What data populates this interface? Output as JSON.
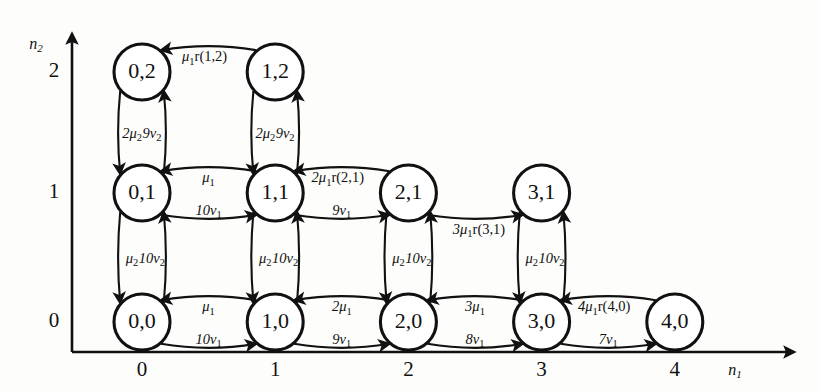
{
  "axes": {
    "x": {
      "name": "n1",
      "name_base": "n",
      "name_sub": "1",
      "ticks": [
        "0",
        "1",
        "2",
        "3",
        "4"
      ]
    },
    "y": {
      "name": "n2",
      "name_base": "n",
      "name_sub": "2",
      "ticks": [
        "0",
        "1",
        "2"
      ]
    }
  },
  "nodes": [
    {
      "id": "0-0",
      "label": "0,0",
      "n1": 0,
      "n2": 0
    },
    {
      "id": "1-0",
      "label": "1,0",
      "n1": 1,
      "n2": 0
    },
    {
      "id": "2-0",
      "label": "2,0",
      "n1": 2,
      "n2": 0
    },
    {
      "id": "3-0",
      "label": "3,0",
      "n1": 3,
      "n2": 0
    },
    {
      "id": "4-0",
      "label": "4,0",
      "n1": 4,
      "n2": 0
    },
    {
      "id": "0-1",
      "label": "0,1",
      "n1": 0,
      "n2": 1
    },
    {
      "id": "1-1",
      "label": "1,1",
      "n1": 1,
      "n2": 1
    },
    {
      "id": "2-1",
      "label": "2,1",
      "n1": 2,
      "n2": 1
    },
    {
      "id": "3-1",
      "label": "3,1",
      "n1": 3,
      "n2": 1
    },
    {
      "id": "0-2",
      "label": "0,2",
      "n1": 0,
      "n2": 2
    },
    {
      "id": "1-2",
      "label": "1,2",
      "n1": 1,
      "n2": 2
    }
  ],
  "edges": [
    {
      "from": "0-0",
      "to": "1-0",
      "label": "10v1",
      "base": "10v",
      "sub": "1",
      "pos": "above"
    },
    {
      "from": "1-0",
      "to": "0-0",
      "label": "mu1",
      "base": "μ",
      "sub": "1",
      "pos": "below"
    },
    {
      "from": "1-0",
      "to": "2-0",
      "label": "9v1",
      "base": "9v",
      "sub": "1",
      "pos": "above"
    },
    {
      "from": "2-0",
      "to": "1-0",
      "label": "2mu1",
      "base": "2μ",
      "sub": "1",
      "pos": "below"
    },
    {
      "from": "2-0",
      "to": "3-0",
      "label": "8v1",
      "base": "8v",
      "sub": "1",
      "pos": "above"
    },
    {
      "from": "3-0",
      "to": "2-0",
      "label": "3mu1",
      "base": "3μ",
      "sub": "1",
      "pos": "below"
    },
    {
      "from": "3-0",
      "to": "4-0",
      "label": "7v1",
      "base": "7v",
      "sub": "1",
      "pos": "above"
    },
    {
      "from": "4-0",
      "to": "3-0",
      "label": "4mu1r(4,0)",
      "base": "4μ",
      "sub": "1",
      "tail": "r(4,0)",
      "pos": "below"
    },
    {
      "from": "0-1",
      "to": "1-1",
      "label": "10v1",
      "base": "10v",
      "sub": "1",
      "pos": "above"
    },
    {
      "from": "1-1",
      "to": "0-1",
      "label": "mu1",
      "base": "μ",
      "sub": "1",
      "pos": "below"
    },
    {
      "from": "1-1",
      "to": "2-1",
      "label": "9v1",
      "base": "9v",
      "sub": "1",
      "pos": "above"
    },
    {
      "from": "2-1",
      "to": "1-1",
      "label": "2mu1r(2,1)",
      "base": "2μ",
      "sub": "1",
      "tail": "r(2,1)",
      "pos": "below"
    },
    {
      "from": "2-1",
      "to": "3-1",
      "label": "3mu1r(3,1)",
      "base": "3μ",
      "sub": "1",
      "tail": "r(3,1)",
      "pos": "below"
    },
    {
      "from": "1-2",
      "to": "0-2",
      "label": "mu1r(1,2)",
      "base": "μ",
      "sub": "1",
      "tail": "r(1,2)",
      "pos": "below"
    },
    {
      "from": "0-0",
      "to": "0-1",
      "label": "10v2",
      "base": "10v",
      "sub": "2",
      "pos": "left"
    },
    {
      "from": "0-1",
      "to": "0-0",
      "label": "mu2",
      "base": "μ",
      "sub": "2",
      "pos": "right"
    },
    {
      "from": "1-0",
      "to": "1-1",
      "label": "10v2",
      "base": "10v",
      "sub": "2",
      "pos": "left"
    },
    {
      "from": "1-1",
      "to": "1-0",
      "label": "mu2",
      "base": "μ",
      "sub": "2",
      "pos": "right"
    },
    {
      "from": "2-0",
      "to": "2-1",
      "label": "10v2",
      "base": "10v",
      "sub": "2",
      "pos": "left"
    },
    {
      "from": "2-1",
      "to": "2-0",
      "label": "mu2",
      "base": "μ",
      "sub": "2",
      "pos": "right"
    },
    {
      "from": "3-0",
      "to": "3-1",
      "label": "10v2",
      "base": "10v",
      "sub": "2",
      "pos": "left"
    },
    {
      "from": "3-1",
      "to": "3-0",
      "label": "mu2",
      "base": "μ",
      "sub": "2",
      "pos": "right"
    },
    {
      "from": "0-1",
      "to": "0-2",
      "label": "9v2",
      "base": "9v",
      "sub": "2",
      "pos": "left"
    },
    {
      "from": "0-2",
      "to": "0-1",
      "label": "2mu2",
      "base": "2μ",
      "sub": "2",
      "pos": "right"
    },
    {
      "from": "1-1",
      "to": "1-2",
      "label": "9v2",
      "base": "9v",
      "sub": "2",
      "pos": "left"
    },
    {
      "from": "1-2",
      "to": "1-1",
      "label": "2mu2",
      "base": "2μ",
      "sub": "2",
      "pos": "right"
    }
  ],
  "colors": {
    "stroke": "#111111",
    "node_fill": "#ffffff",
    "background": "#fdfdfb"
  }
}
